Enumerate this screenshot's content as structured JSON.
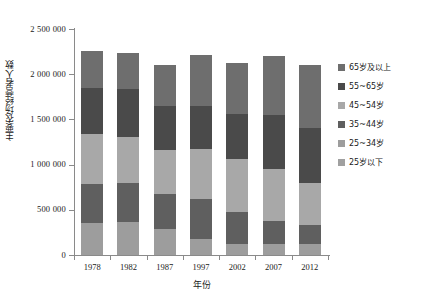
{
  "chart_data": {
    "type": "bar",
    "stacked": true,
    "title": "",
    "xlabel": "年份",
    "ylabel": "主要农场经营者人数",
    "categories": [
      "1978",
      "1982",
      "1987",
      "1997",
      "2002",
      "2007",
      "2012"
    ],
    "ylim": [
      0,
      2500000
    ],
    "ytick_values": [
      0,
      500000,
      1000000,
      1500000,
      2000000,
      2500000
    ],
    "ytick_labels": [
      "0",
      "500 000",
      "1 000 000",
      "1 500 000",
      "2 000 000",
      "2 500 000"
    ],
    "grid": false,
    "legend_position": "right",
    "series": [
      {
        "name": "25岁以下",
        "color": "#9d9d9d",
        "values": [
          355000,
          365000,
          285000,
          180000,
          125000,
          120000,
          125000
        ]
      },
      {
        "name": "25~34岁",
        "color": "#5f5f5f",
        "values": [
          430000,
          430000,
          395000,
          435000,
          355000,
          260000,
          205000
        ]
      },
      {
        "name": "35~44岁",
        "color": "#a8a8a8",
        "values": [
          555000,
          510000,
          485000,
          560000,
          580000,
          575000,
          470000
        ]
      },
      {
        "name": "45~54岁",
        "color": "#4d4d4d",
        "values": [
          505000,
          535000,
          480000,
          470000,
          500000,
          590000,
          600000
        ]
      },
      {
        "name": "55~65岁",
        "color": "#6e6e6e",
        "values": [
          410000,
          400000,
          455000,
          570000,
          565000,
          655000,
          705000
        ]
      },
      {
        "name": "65岁及以上",
        "color": "#6e6e6e",
        "values": [
          0,
          0,
          0,
          0,
          0,
          0,
          0
        ]
      }
    ],
    "legend_entries": [
      {
        "label": "65岁及以上",
        "color": "#6e6e6e"
      },
      {
        "label": "55~65岁",
        "color": "#4a4a4a"
      },
      {
        "label": "45~54岁",
        "color": "#a8a8a8"
      },
      {
        "label": "35~44岁",
        "color": "#5f5f5f"
      },
      {
        "label": "25~34岁",
        "color": "#9d9d9d"
      },
      {
        "label": "25岁以下",
        "color": "#a0a0a0"
      }
    ],
    "stack_order_bottom_to_top": [
      "25岁以下",
      "25~34岁",
      "35~44岁",
      "45~54岁",
      "55~65岁",
      "65岁及以上"
    ],
    "bars": [
      {
        "category": "1978",
        "total": 2255000,
        "segments": [
          {
            "name": "25岁以下",
            "value": 355000,
            "color": "#9d9d9d"
          },
          {
            "name": "25~34岁",
            "value": 430000,
            "color": "#5f5f5f"
          },
          {
            "name": "35~44岁",
            "value": 555000,
            "color": "#a8a8a8"
          },
          {
            "name": "45~54岁",
            "value": 505000,
            "color": "#4a4a4a"
          },
          {
            "name": "55~65岁",
            "value": 410000,
            "color": "#6e6e6e"
          }
        ]
      },
      {
        "category": "1982",
        "total": 2240000,
        "segments": [
          {
            "name": "25岁以下",
            "value": 365000,
            "color": "#9d9d9d"
          },
          {
            "name": "25~34岁",
            "value": 430000,
            "color": "#5f5f5f"
          },
          {
            "name": "35~44岁",
            "value": 510000,
            "color": "#a8a8a8"
          },
          {
            "name": "45~54岁",
            "value": 535000,
            "color": "#4a4a4a"
          },
          {
            "name": "55~65岁",
            "value": 400000,
            "color": "#6e6e6e"
          }
        ]
      },
      {
        "category": "1987",
        "total": 2100000,
        "segments": [
          {
            "name": "25岁以下",
            "value": 285000,
            "color": "#9d9d9d"
          },
          {
            "name": "25~34岁",
            "value": 395000,
            "color": "#5f5f5f"
          },
          {
            "name": "35~44岁",
            "value": 485000,
            "color": "#a8a8a8"
          },
          {
            "name": "45~54岁",
            "value": 480000,
            "color": "#4a4a4a"
          },
          {
            "name": "55~65岁",
            "value": 455000,
            "color": "#6e6e6e"
          }
        ]
      },
      {
        "category": "1997",
        "total": 2215000,
        "segments": [
          {
            "name": "25岁以下",
            "value": 180000,
            "color": "#9d9d9d"
          },
          {
            "name": "25~34岁",
            "value": 435000,
            "color": "#5f5f5f"
          },
          {
            "name": "35~44岁",
            "value": 560000,
            "color": "#a8a8a8"
          },
          {
            "name": "45~54岁",
            "value": 470000,
            "color": "#4a4a4a"
          },
          {
            "name": "55~65岁",
            "value": 570000,
            "color": "#6e6e6e"
          }
        ]
      },
      {
        "category": "2002",
        "total": 2125000,
        "segments": [
          {
            "name": "25岁以下",
            "value": 125000,
            "color": "#9d9d9d"
          },
          {
            "name": "25~34岁",
            "value": 355000,
            "color": "#5f5f5f"
          },
          {
            "name": "35~44岁",
            "value": 580000,
            "color": "#a8a8a8"
          },
          {
            "name": "45~54岁",
            "value": 500000,
            "color": "#4a4a4a"
          },
          {
            "name": "55~65岁",
            "value": 565000,
            "color": "#6e6e6e"
          }
        ]
      },
      {
        "category": "2007",
        "total": 2200000,
        "segments": [
          {
            "name": "25岁以下",
            "value": 120000,
            "color": "#9d9d9d"
          },
          {
            "name": "25~34岁",
            "value": 260000,
            "color": "#5f5f5f"
          },
          {
            "name": "35~44岁",
            "value": 575000,
            "color": "#a8a8a8"
          },
          {
            "name": "45~54岁",
            "value": 590000,
            "color": "#4a4a4a"
          },
          {
            "name": "55~65岁",
            "value": 655000,
            "color": "#6e6e6e"
          }
        ]
      },
      {
        "category": "2012",
        "total": 2105000,
        "segments": [
          {
            "name": "25岁以下",
            "value": 125000,
            "color": "#9d9d9d"
          },
          {
            "name": "25~34岁",
            "value": 205000,
            "color": "#5f5f5f"
          },
          {
            "name": "35~44岁",
            "value": 470000,
            "color": "#a8a8a8"
          },
          {
            "name": "45~54岁",
            "value": 600000,
            "color": "#4a4a4a"
          },
          {
            "name": "55~65岁",
            "value": 705000,
            "color": "#6e6e6e"
          }
        ]
      }
    ]
  }
}
